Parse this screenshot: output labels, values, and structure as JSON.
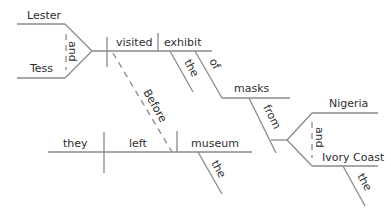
{
  "diagram": {
    "type": "sentence-diagram",
    "colors": {
      "line": "#8a8a8a",
      "text": "#2e2e2e",
      "background": "#ffffff"
    },
    "main_clause": {
      "subjects": [
        "Lester",
        "Tess"
      ],
      "subject_conjunction": "and",
      "verb": "visited",
      "direct_object": "exhibit",
      "object_modifier": "the",
      "preposition_1": "of",
      "prep_object_1": "masks",
      "preposition_2": "from",
      "compound_objects": [
        "Nigeria",
        "Ivory Coast"
      ],
      "compound_conjunction": "and",
      "ivory_coast_modifier": "the"
    },
    "subordinating_conjunction": "Before",
    "subordinate_clause": {
      "subject": "they",
      "verb": "left",
      "direct_object": "museum",
      "object_modifier": "the"
    }
  }
}
